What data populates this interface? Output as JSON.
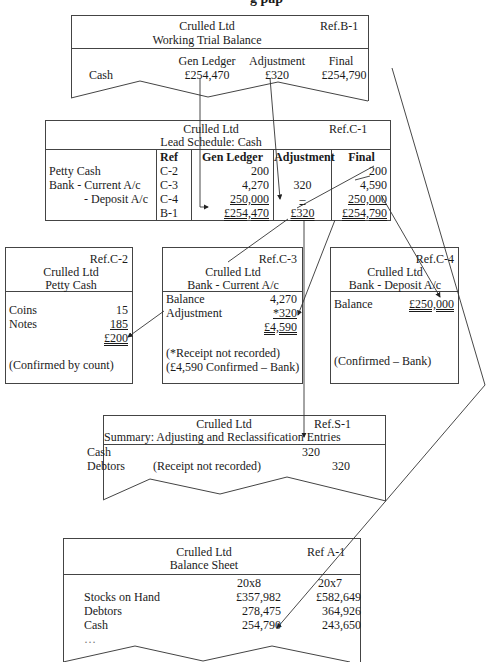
{
  "page": {
    "title_fragment": "g pap"
  },
  "working_trial_balance": {
    "company": "Crulled Ltd",
    "title": "Working Trial Balance",
    "ref": "Ref.B-1",
    "columns": [
      "Gen Ledger",
      "Adjustment",
      "Final"
    ],
    "row": {
      "label": "Cash",
      "gen_ledger": "£254,470",
      "adjustment": "£320",
      "final": "£254,790"
    }
  },
  "lead_schedule": {
    "company": "Crulled Ltd",
    "title": "Lead Schedule: Cash",
    "ref": "Ref.C-1",
    "columns": [
      "Ref",
      "Gen Ledger",
      "Adjustment",
      "Final"
    ],
    "rows": [
      {
        "label": "Petty Cash",
        "ref": "C-2",
        "gen_ledger": "200",
        "adjustment": "",
        "final": "200"
      },
      {
        "label": "Bank - Current A/c",
        "ref": "C-3",
        "gen_ledger": "4,270",
        "adjustment": "320",
        "final": "4,590"
      },
      {
        "label": "- Deposit A/c",
        "ref": "C-4",
        "gen_ledger": "250,000",
        "adjustment": "–",
        "final": "250,000"
      },
      {
        "label": "",
        "ref": "B-1",
        "gen_ledger": "£254,470",
        "adjustment": "£320",
        "final": "£254,790"
      }
    ]
  },
  "petty_cash": {
    "ref": "Ref.C-2",
    "company": "Crulled Ltd",
    "title": "Petty Cash",
    "rows": [
      {
        "label": "Coins",
        "value": "15"
      },
      {
        "label": "Notes",
        "value": "185"
      }
    ],
    "total": "£200",
    "note": "(Confirmed by count)"
  },
  "bank_current": {
    "ref": "Ref.C-3",
    "company": "Crulled Ltd",
    "title": "Bank - Current A/c",
    "rows": [
      {
        "label": "Balance",
        "value": "4,270"
      },
      {
        "label": "Adjustment",
        "value": "*320"
      }
    ],
    "total": "£4,590",
    "notes": [
      "(*Receipt not recorded)",
      "(£4,590 Confirmed – Bank)"
    ]
  },
  "bank_deposit": {
    "ref": "Ref.C-4",
    "company": "Crulled Ltd",
    "title": "Bank - Deposit A/c",
    "row": {
      "label": "Balance",
      "value": "£250,000"
    },
    "note": "(Confirmed – Bank)"
  },
  "summary": {
    "company": "Crulled Ltd",
    "title": "Summary: Adjusting and Reclassification Entries",
    "ref": "Ref.S-1",
    "rows": [
      {
        "label": "Cash",
        "description": "",
        "debit": "320",
        "credit": ""
      },
      {
        "label": "Debtors",
        "description": "(Receipt not recorded)",
        "debit": "",
        "credit": "320"
      }
    ]
  },
  "balance_sheet": {
    "company": "Crulled Ltd",
    "title": "Balance Sheet",
    "ref": "Ref A-1",
    "columns": [
      "20x8",
      "20x7"
    ],
    "rows": [
      {
        "label": "Stocks on Hand",
        "y1": "£357,982",
        "y2": "£582,649"
      },
      {
        "label": "Debtors",
        "y1": "278,475",
        "y2": "364,926"
      },
      {
        "label": "Cash",
        "y1": "254,790",
        "y2": "243,650"
      },
      {
        "label": "…",
        "y1": "",
        "y2": ""
      }
    ]
  },
  "colors": {
    "line": "#444444",
    "text": "#1a1a1a",
    "background": "#ffffff"
  }
}
